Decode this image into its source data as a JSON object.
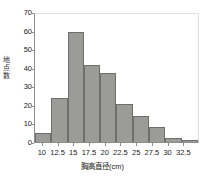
{
  "chart_data": {
    "type": "bar",
    "title": "",
    "subtitle": "",
    "xlabel": "胸高直径(cm)",
    "ylabel": "地点数",
    "ylabel_chars": [
      "地",
      "点",
      "数"
    ],
    "categories": [
      "10-12.5",
      "12.5-15",
      "15-17.5",
      "17.5-20",
      "20-22.5",
      "22.5-25",
      "25-27.5",
      "27.5-30",
      "30-32.5",
      "32.5-35"
    ],
    "values": [
      5,
      24,
      60,
      42,
      38,
      21,
      14,
      8,
      2,
      1
    ],
    "bin_edges": [
      10,
      12.5,
      15,
      17.5,
      20,
      22.5,
      25,
      27.5,
      30,
      32.5,
      35
    ],
    "x_tick_labels": [
      "10",
      "12.5",
      "15",
      "17.5",
      "20",
      "22.5",
      "25",
      "27.5",
      "30",
      "32.5"
    ],
    "x_tick_values": [
      10,
      12.5,
      15,
      17.5,
      20,
      22.5,
      25,
      27.5,
      30,
      32.5
    ],
    "xlim": [
      8.75,
      35
    ],
    "y_tick_labels": [
      "70",
      "60",
      "50",
      "40",
      "30",
      "20",
      "10",
      "0"
    ],
    "y_tick_values": [
      70,
      60,
      50,
      40,
      30,
      20,
      10,
      0
    ],
    "ylim": [
      0,
      70
    ],
    "grid": false,
    "legend": false,
    "legend_position": "none",
    "bar_fill_color": "#9b9b97",
    "bar_edge_color": "#6e6e6a",
    "axis_color": "#8d8d8d",
    "background_color": "#ffffff",
    "text_color": "#1a1a1a"
  }
}
